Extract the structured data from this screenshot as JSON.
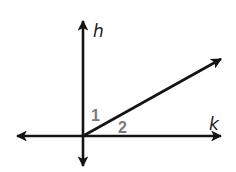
{
  "diagram": {
    "type": "geometry-lines-and-angles",
    "colors": {
      "line": "#141414",
      "line_label": "#1a1a1a",
      "angle_label": "#7a7a7a",
      "background": "#ffffff"
    },
    "lines": [
      {
        "name": "h",
        "label": "h",
        "orientation": "vertical",
        "arrows": "both"
      },
      {
        "name": "k",
        "label": "k",
        "orientation": "horizontal",
        "arrows": "both"
      },
      {
        "name": "ray",
        "label": "",
        "orientation": "diagonal-up-right",
        "arrows": "end"
      }
    ],
    "angles": [
      {
        "id": "1",
        "label": "1",
        "between": "line h and ray"
      },
      {
        "id": "2",
        "label": "2",
        "between": "ray and line k"
      }
    ],
    "labels": {
      "h": "h",
      "k": "k",
      "angle1": "1",
      "angle2": "2"
    }
  }
}
